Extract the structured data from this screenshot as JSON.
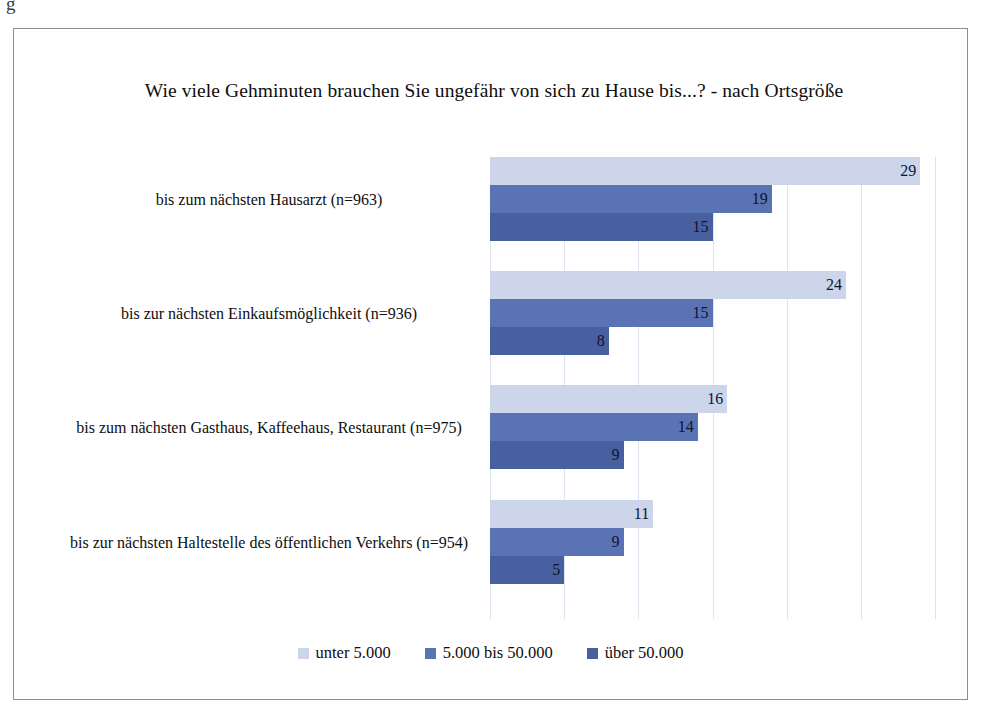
{
  "scan_artifact": "g",
  "chart_data": {
    "type": "bar",
    "orientation": "horizontal",
    "title": "Wie viele Gehminuten brauchen Sie ungefähr von sich zu Hause bis...? - nach Ortsgröße",
    "xlabel": "",
    "ylabel": "",
    "xlim": [
      0,
      30
    ],
    "grid": true,
    "gridlines": [
      0,
      5,
      10,
      15,
      20,
      25,
      30
    ],
    "legend_position": "bottom",
    "categories": [
      "bis zum nächsten Hausarzt (n=963)",
      "bis zur nächsten Einkaufsmöglichkeit (n=936)",
      "bis zum nächsten Gasthaus, Kaffeehaus, Restaurant (n=975)",
      "bis zur nächsten Haltestelle des öffentlichen Verkehrs (n=954)"
    ],
    "series": [
      {
        "name": "unter 5.000",
        "color": "#ccd5ea",
        "values": [
          29,
          24,
          16,
          11
        ]
      },
      {
        "name": "5.000 bis 50.000",
        "color": "#5a73b5",
        "values": [
          19,
          15,
          14,
          9
        ]
      },
      {
        "name": "über 50.000",
        "color": "#48609f",
        "values": [
          15,
          8,
          9,
          5
        ]
      }
    ]
  }
}
